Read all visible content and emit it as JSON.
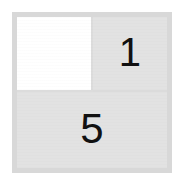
{
  "figure": {
    "kind": "fraction-grid",
    "frame": {
      "border_color": "#d8d8d8",
      "background_color": "#e2e2e2"
    }
  },
  "cells": [
    {
      "id": "top-left",
      "label": "",
      "fill": "white",
      "fill_color": "#ffffff",
      "has_numeral": false
    },
    {
      "id": "top-right",
      "label": "1",
      "fill": "gray",
      "fill_color": "#e2e2e2",
      "has_numeral": true
    },
    {
      "id": "bottom",
      "label": "5",
      "fill": "gray",
      "fill_color": "#e2e2e2",
      "has_numeral": true
    }
  ],
  "colors": {
    "page_background": "#ffffff",
    "frame_border": "#d8d8d8",
    "cell_gray": "#e2e2e2",
    "cell_white": "#ffffff",
    "divider": "#dcdcdc",
    "numeral": "#111111"
  }
}
